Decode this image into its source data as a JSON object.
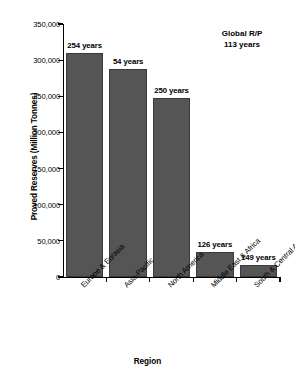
{
  "chart_data": {
    "type": "bar",
    "title": "",
    "xlabel": "Region",
    "ylabel": "Proved Reserves (Million Tonnes)",
    "categories": [
      "Europe & Eurasia",
      "Asia-Pacific",
      "North America",
      "Middle East & Africa",
      "South & Central America"
    ],
    "values": [
      310000,
      288000,
      247000,
      34000,
      16000
    ],
    "bar_labels": [
      "254 years",
      "54 years",
      "250 years",
      "126 years",
      "149 years"
    ],
    "ylim": [
      0,
      350000
    ],
    "ytick_values": [
      0,
      50000,
      100000,
      150000,
      200000,
      250000,
      300000,
      350000
    ],
    "ytick_labels": [
      "0",
      "50,000",
      "100,000",
      "150,000",
      "200,000",
      "250,000",
      "300,000",
      "350,000"
    ],
    "grid": false,
    "legend": "none",
    "bar_color": "#555555",
    "annotations": [
      {
        "line1": "Global R/P",
        "line2": "113 years"
      }
    ]
  },
  "annotation": {
    "title": "Global R/P",
    "value": "113 years"
  },
  "axes": {
    "y_title": "Proved Reserves (Million Tonnes)",
    "x_title": "Region"
  }
}
